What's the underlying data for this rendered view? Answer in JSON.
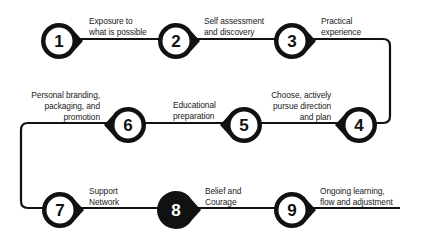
{
  "diagram": {
    "type": "process-path",
    "colors": {
      "stroke": "#111111",
      "fill": "#ffffff",
      "highlight": "#111111",
      "highlight_text": "#ffffff",
      "text": "#222222"
    },
    "steps": [
      {
        "number": "1",
        "line1": "Exposure to",
        "line2": "what is possible",
        "line3": ""
      },
      {
        "number": "2",
        "line1": "Self assessment",
        "line2": "and discovery",
        "line3": ""
      },
      {
        "number": "3",
        "line1": "Practical",
        "line2": "experience",
        "line3": ""
      },
      {
        "number": "4",
        "line1": "Choose, actively",
        "line2": "pursue direction",
        "line3": "and plan"
      },
      {
        "number": "5",
        "line1": "Educational",
        "line2": "preparation",
        "line3": ""
      },
      {
        "number": "6",
        "line1": "Personal branding,",
        "line2": "packaging, and",
        "line3": "promotion"
      },
      {
        "number": "7",
        "line1": "Support",
        "line2": "Network",
        "line3": ""
      },
      {
        "number": "8",
        "line1": "Belief and",
        "line2": "Courage",
        "line3": ""
      },
      {
        "number": "9",
        "line1": "Ongoing learning,",
        "line2": "flow and adjustment",
        "line3": ""
      }
    ]
  }
}
